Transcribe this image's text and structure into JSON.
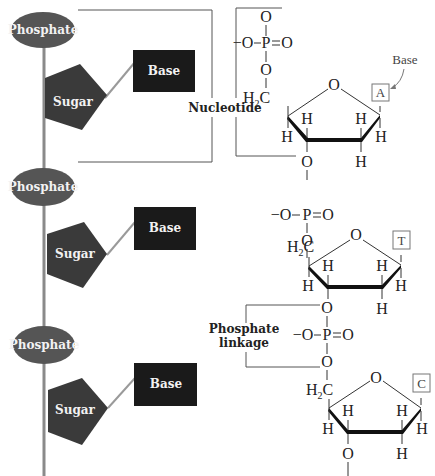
{
  "colors": {
    "phosphate_fill": "#555555",
    "sugar_fill": "#3a3a3a",
    "base_fill": "#1a1a1a",
    "backbone": "#8a8a8a",
    "label_text": "#f2f2f2",
    "bond": "#333333"
  },
  "schematic": {
    "units": [
      {
        "phosphate_label": "Phosphate",
        "sugar_label": "Sugar",
        "base_label": "Base"
      },
      {
        "phosphate_label": "Phosphate",
        "sugar_label": "Sugar",
        "base_label": "Base"
      },
      {
        "phosphate_label": "Phosphate",
        "sugar_label": "Sugar",
        "base_label": "Base"
      }
    ]
  },
  "annotations": {
    "nucleotide": "Nucleotide",
    "phosphate_linkage_line1": "Phosphate",
    "phosphate_linkage_line2": "linkage",
    "base_callout": "Base"
  },
  "structure": {
    "atoms": {
      "O": "O",
      "O_minus": "−O",
      "P": "P",
      "H": "H",
      "H2C_H": "H",
      "H2C_sub": "2",
      "H2C_C": "C"
    },
    "bases": [
      "A",
      "T",
      "C"
    ]
  }
}
